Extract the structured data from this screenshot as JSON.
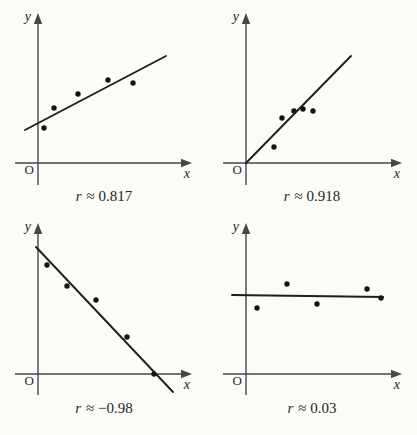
{
  "page": {
    "background": "#fbfbf8"
  },
  "figure": {
    "colors": {
      "axis": "#474747",
      "trend_line": "#1e1e1e",
      "point": "#141414",
      "text": "#1f1f1f"
    }
  },
  "chart_data": [
    {
      "type": "scatter",
      "panel": "top-left",
      "label": "r ≈ 0.817",
      "caption": {
        "symbol": "r",
        "value": "≈ 0.817"
      },
      "correlation": 0.817,
      "trend": "moderate positive linear",
      "axis_labels": {
        "y": "y",
        "x": "x",
        "origin": "O"
      },
      "axes_unlabeled": true,
      "points_px": [
        [
          44,
          128
        ],
        [
          54,
          108
        ],
        [
          78,
          94
        ],
        [
          108,
          80
        ],
        [
          133,
          83
        ]
      ],
      "trend_line_px": [
        25,
        130,
        166,
        56
      ],
      "axes_px": {
        "y_axis_x": 38,
        "x_axis_y": 163,
        "y_top": 13,
        "y_bottom": 185,
        "x_left": 15,
        "x_right": 192
      }
    },
    {
      "type": "scatter",
      "panel": "top-right",
      "label": "r ≈ 0.918",
      "caption": {
        "symbol": "r",
        "value": "≈ 0.918"
      },
      "correlation": 0.918,
      "trend": "strong positive linear through origin",
      "axis_labels": {
        "y": "y",
        "x": "x",
        "origin": "O"
      },
      "axes_unlabeled": true,
      "points_px": [
        [
          66,
          147
        ],
        [
          74,
          118
        ],
        [
          86,
          111
        ],
        [
          95,
          109
        ],
        [
          105,
          111
        ]
      ],
      "trend_line_px": [
        38,
        163,
        143,
        56
      ],
      "axes_px": {
        "y_axis_x": 38,
        "x_axis_y": 163,
        "y_top": 13,
        "y_bottom": 185,
        "x_left": 15,
        "x_right": 194
      }
    },
    {
      "type": "scatter",
      "panel": "bottom-left",
      "label": "r ≈ −0.98",
      "caption": {
        "symbol": "r",
        "value": "≈ −0.98"
      },
      "correlation": -0.98,
      "trend": "very strong negative linear",
      "axis_labels": {
        "y": "y",
        "x": "x",
        "origin": "O"
      },
      "axes_unlabeled": true,
      "points_px": [
        [
          47,
          53
        ],
        [
          67,
          74
        ],
        [
          96,
          88
        ],
        [
          127,
          125
        ],
        [
          154,
          162
        ]
      ],
      "trend_line_px": [
        36,
        35,
        173,
        180
      ],
      "axes_px": {
        "y_axis_x": 38,
        "x_axis_y": 162,
        "y_top": 11,
        "y_bottom": 183,
        "x_left": 15,
        "x_right": 192
      }
    },
    {
      "type": "scatter",
      "panel": "bottom-right",
      "label": "r ≈ 0.03",
      "caption": {
        "symbol": "r",
        "value": "≈ 0.03"
      },
      "correlation": 0.03,
      "trend": "no linear correlation, nearly horizontal line",
      "axis_labels": {
        "y": "y",
        "x": "x",
        "origin": "O"
      },
      "axes_unlabeled": true,
      "points_px": [
        [
          49,
          96
        ],
        [
          79,
          72
        ],
        [
          109,
          92
        ],
        [
          159,
          77
        ],
        [
          173,
          86
        ]
      ],
      "trend_line_px": [
        24,
        83,
        175,
        85
      ],
      "axes_px": {
        "y_axis_x": 38,
        "x_axis_y": 162,
        "y_top": 11,
        "y_bottom": 183,
        "x_left": 15,
        "x_right": 194
      }
    }
  ]
}
